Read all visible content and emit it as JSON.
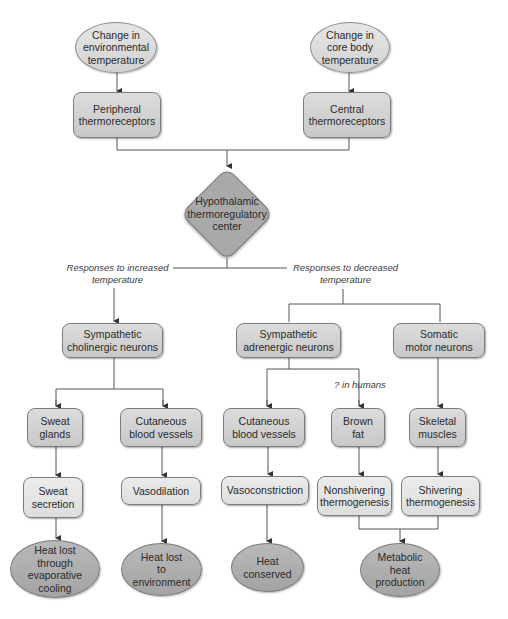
{
  "diagram": {
    "inputs": {
      "env_temp": "Change in\nenvironmental\ntemperature",
      "core_temp": "Change in\ncore body\ntemperature"
    },
    "receptors": {
      "peripheral": "Peripheral\nthermoreceptors",
      "central": "Central\nthermoreceptors"
    },
    "center": "Hypothalamic\nthermoregulatory\ncenter",
    "branch_labels": {
      "increased": "Responses to increased\ntemperature",
      "decreased": "Responses to decreased\ntemperature",
      "in_humans": "? in humans"
    },
    "effector_neurons": {
      "cholinergic": "Sympathetic\ncholinergic neurons",
      "adrenergic": "Sympathetic\nadrenergic neurons",
      "somatic": "Somatic\nmotor neurons"
    },
    "targets": {
      "sweat_glands": "Sweat\nglands",
      "cutaneous_vessels_warm": "Cutaneous\nblood vessels",
      "cutaneous_vessels_cold": "Cutaneous\nblood vessels",
      "brown_fat": "Brown\nfat",
      "skeletal_muscles": "Skeletal\nmuscles"
    },
    "responses": {
      "sweat_secretion": "Sweat\nsecretion",
      "vasodilation": "Vasodilation",
      "vasoconstriction": "Vasoconstriction",
      "nonshivering": "Nonshivering\nthermogenesis",
      "shivering": "Shivering\nthermogenesis"
    },
    "outcomes": {
      "evaporative": "Heat lost\nthrough\nevaporative\ncooling",
      "environment": "Heat lost\nto\nenvironment",
      "conserved": "Heat\nconserved",
      "metabolic": "Metabolic\nheat\nproduction"
    }
  }
}
